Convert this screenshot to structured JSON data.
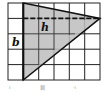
{
  "figure": {
    "type": "grid-triangle",
    "grid": {
      "columns": 6,
      "rows": 5
    },
    "labels": {
      "height": "h",
      "base": "b"
    },
    "colors": {
      "fill": "#bdbdbd",
      "line": "#111111",
      "grid": "#222222",
      "background": "#ffffff"
    }
  },
  "footer": {
    "left": "ı",
    "center": "||||||",
    "right": "·ı"
  }
}
